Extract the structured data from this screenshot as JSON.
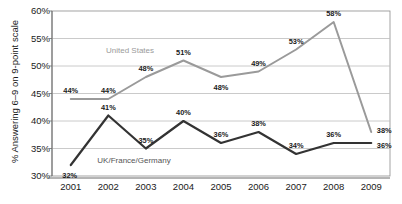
{
  "chart_data": {
    "type": "line",
    "title": "",
    "xlabel": "",
    "ylabel": "% Answering 6–9 on 9-point scale",
    "categories": [
      "2001",
      "2002",
      "2003",
      "2004",
      "2005",
      "2006",
      "2007",
      "2008",
      "2009"
    ],
    "ylim": [
      30,
      60
    ],
    "ytick_labels": [
      "30%",
      "35%",
      "40%",
      "45%",
      "50%",
      "55%",
      "60%"
    ],
    "yticks": [
      30,
      35,
      40,
      45,
      50,
      55,
      60
    ],
    "grid": true,
    "grid_axis": "y",
    "legend_position": "inline-annotation",
    "series": [
      {
        "name": "United States",
        "color": "#9a9a9a",
        "values": [
          44,
          44,
          48,
          51,
          48,
          49,
          53,
          58,
          38
        ],
        "labels": [
          "44%",
          "44%",
          "48%",
          "51%",
          "48%",
          "49%",
          "53%",
          "58%",
          "38%"
        ]
      },
      {
        "name": "UK/France/Germany",
        "color": "#333333",
        "values": [
          32,
          41,
          35,
          40,
          36,
          38,
          34,
          36,
          36
        ],
        "labels": [
          "32%",
          "41%",
          "35%",
          "40%",
          "36%",
          "38%",
          "34%",
          "36%",
          "36%"
        ]
      }
    ]
  },
  "annotations": {
    "us_label": "United States",
    "eu_label": "UK/France/Germany"
  }
}
